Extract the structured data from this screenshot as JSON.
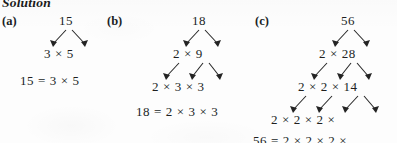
{
  "page": {
    "heading": "Solution",
    "background_color": "#fdfdfd",
    "ink_color": "#201f1f",
    "note_clipped_top": "Solution heading is cropped at top edge",
    "note_clipped_right": "Part (c) factor tree and final equation are cropped at right edge"
  },
  "parts": {
    "a": {
      "label": "(a)",
      "root": "15",
      "levels": [
        "15",
        "3  ×  5"
      ],
      "equation": "15  =  3  ×  5"
    },
    "b": {
      "label": "(b)",
      "root": "18",
      "levels": [
        "18",
        "2  ×  9",
        "2  ×  3  ×  3"
      ],
      "equation": "18  =  2  ×  3  ×  3"
    },
    "c": {
      "label": "(c)",
      "root": "56",
      "levels": [
        "56",
        "2  ×  28",
        "2  ×  2  ×  14",
        "2  ×  2  ×  2  ×"
      ],
      "equation": "56  =  2  ×  2  ×  2  ×"
    }
  }
}
